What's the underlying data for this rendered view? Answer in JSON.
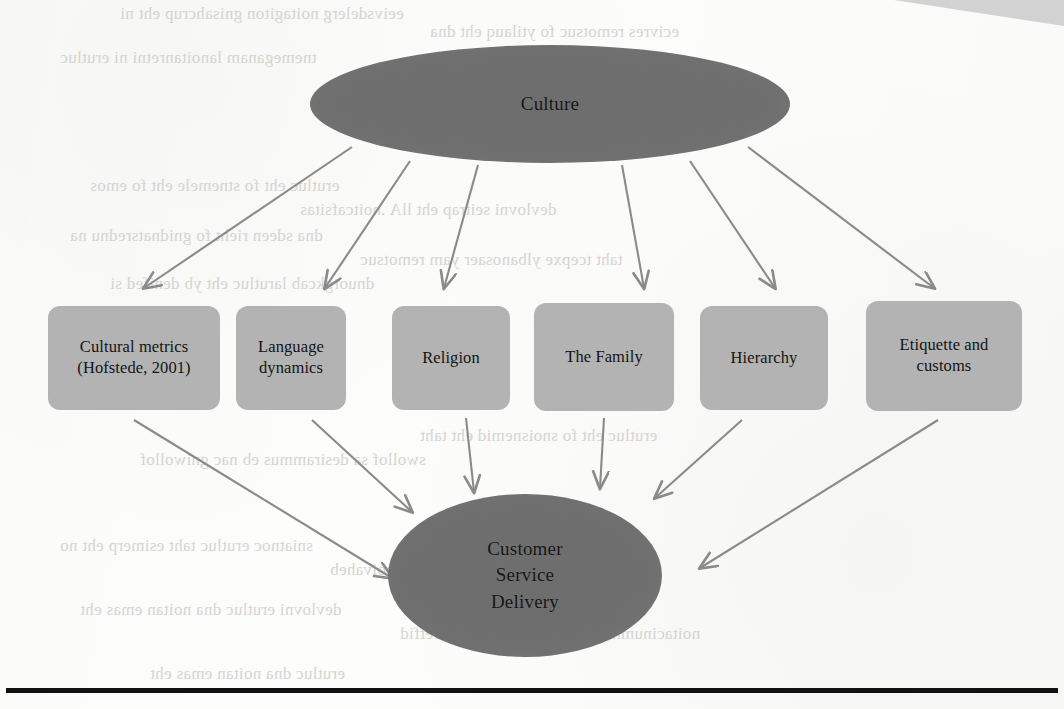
{
  "figure": {
    "type": "hierarchy-diagram",
    "root": {
      "id": "culture",
      "label": "Culture",
      "shape": "ellipse",
      "fill": "#6e6e6e"
    },
    "outcome": {
      "id": "customer-service-delivery",
      "line1": "Customer",
      "line2": "Service",
      "line3": "Delivery",
      "shape": "ellipse",
      "fill": "#6e6e6e"
    },
    "factors": [
      {
        "id": "cultural-metrics",
        "line1": "Cultural metrics",
        "line2": "(Hofstede, 2001)"
      },
      {
        "id": "language-dynamics",
        "line1": "Language",
        "line2": "dynamics"
      },
      {
        "id": "religion",
        "line1": "Religion",
        "line2": ""
      },
      {
        "id": "the-family",
        "line1": "The Family",
        "line2": ""
      },
      {
        "id": "hierarchy",
        "line1": "Hierarchy",
        "line2": ""
      },
      {
        "id": "etiquette-and-customs",
        "line1": "Etiquette and",
        "line2": "customs"
      }
    ],
    "colors": {
      "node_dark": "#6e6e6e",
      "node_light": "#b3b3b3",
      "arrow": "#8a8a8a",
      "text": "#141414",
      "rule": "#111111",
      "page": "#fdfdfc"
    }
  },
  "background_bleed": [
    {
      "text": "eeivsdelerg noitagiton gnisahcrup eht ni",
      "x": 120,
      "y": 4
    },
    {
      "text": "ecivres remotsuc fo ytilauq eht dna",
      "x": 430,
      "y": 22
    },
    {
      "text": "tnemeganam lanoitanretni ni erutluc",
      "x": 60,
      "y": 48
    },
    {
      "text": "sremotsuc eht yb deviecrep eb lliw",
      "x": 380,
      "y": 70
    },
    {
      "text": "erutluc eht fo stnemele eht fo emos",
      "x": 90,
      "y": 176
    },
    {
      "text": "devlovni seitrap eht llA .noitcafsitas",
      "x": 300,
      "y": 200
    },
    {
      "text": "dna sdeen rieht fo gnidnatsrednu na",
      "x": 70,
      "y": 226
    },
    {
      "text": "taht tcepxe ylbanosaer yam remotsuc",
      "x": 360,
      "y": 250
    },
    {
      "text": "dnuorgkcab larutluc eht yb denifed si",
      "x": 110,
      "y": 274
    },
    {
      "text": "erutluc eht fo snoisnemid eht taht",
      "x": 420,
      "y": 426
    },
    {
      "text": "swollof sa desirammus eb nac gniwollof",
      "x": 140,
      "y": 450
    },
    {
      "text": "sniatnoc erutluc taht esimerp eht no",
      "x": 60,
      "y": 536
    },
    {
      "text": "eht fo tnednepedni si taht ruoivaheb",
      "x": 330,
      "y": 560
    },
    {
      "text": "devlovni erutluc dna noitan emas eht",
      "x": 80,
      "y": 600
    },
    {
      "text": "noitacinummoc fo edom eht ni secnereffid",
      "x": 400,
      "y": 624
    },
    {
      "text": "erutluc dna noitan emas eht",
      "x": 150,
      "y": 664
    }
  ]
}
